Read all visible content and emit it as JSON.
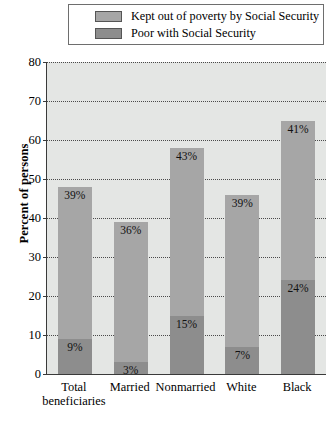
{
  "chart_data": {
    "type": "bar",
    "subtype": "stacked-bar",
    "title": "",
    "xlabel": "",
    "ylabel": "Percent of persons",
    "ylim": [
      0,
      80
    ],
    "ytick_step": 10,
    "yticks": [
      0,
      10,
      20,
      30,
      40,
      50,
      60,
      70,
      80
    ],
    "grid": true,
    "grid_axis": "y",
    "legend_position": "top",
    "categories": [
      "Total beneficiaries",
      "Married",
      "Nonmarried",
      "White",
      "Black"
    ],
    "category_lines": [
      [
        "Total",
        "beneficiaries"
      ],
      [
        "Married"
      ],
      [
        "Nonmarried"
      ],
      [
        "White"
      ],
      [
        "Black"
      ]
    ],
    "series": [
      {
        "name": "Poor with Social Security",
        "color": "#8d8d8d",
        "values": [
          9,
          3,
          15,
          7,
          24
        ],
        "labels": [
          "9%",
          "3%",
          "15%",
          "7%",
          "24%"
        ]
      },
      {
        "name": "Kept out of poverty by Social Security",
        "color": "#a6a6a6",
        "values": [
          39,
          36,
          43,
          39,
          41
        ],
        "labels": [
          "39%",
          "36%",
          "43%",
          "39%",
          "41%"
        ]
      }
    ],
    "totals": [
      48,
      39,
      58,
      46,
      65
    ]
  },
  "legend": {
    "items": [
      {
        "label": "Kept out of poverty by Social Security",
        "color": "#a6a6a6"
      },
      {
        "label": "Poor with Social Security",
        "color": "#8d8d8d"
      }
    ]
  },
  "axis": {
    "y_title": "Percent of persons",
    "y_ticks": [
      "80",
      "70",
      "60",
      "50",
      "40",
      "30",
      "20",
      "10",
      "0"
    ]
  }
}
